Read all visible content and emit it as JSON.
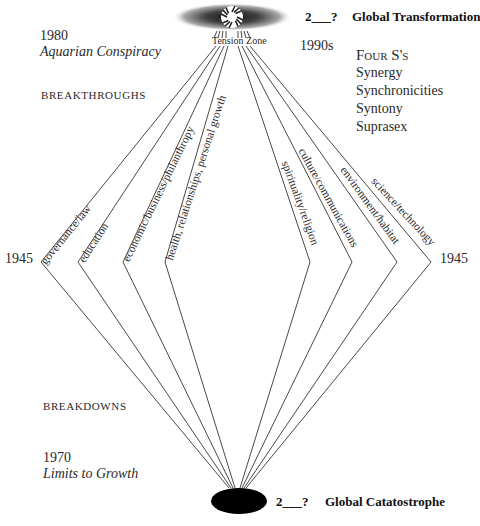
{
  "top": {
    "outcome_year": "2___?",
    "outcome_label": "Global Transformation",
    "tension_zone": "Tension Zone",
    "year_1990s": "1990s",
    "four_s_title": "Four S's",
    "four_s_items": [
      "Synergy",
      "Synchronicities",
      "Syntony",
      "Suprasex"
    ]
  },
  "left_notes": {
    "year_1980": "1980",
    "book_1980": "Aquarian Conspiracy",
    "breakthroughs": "BREAKTHROUGHS",
    "breakdowns": "BREAKDOWNS",
    "year_1970": "1970",
    "book_1970": "Limits to Growth"
  },
  "side_years": {
    "left": "1945",
    "right": "1945"
  },
  "strands": {
    "left": [
      "governance/law",
      "education",
      "economic/business/philanthropy",
      "health, relationships, personal growth"
    ],
    "right": [
      "spirituality/religion",
      "culture/communications",
      "environment/habitat",
      "science/technology"
    ]
  },
  "bottom": {
    "outcome_year": "2___?",
    "outcome_label": "Global Catatostrophe"
  },
  "colors": {
    "line": "#333333",
    "ink": "#2a2a2a",
    "blob": "#000000"
  }
}
